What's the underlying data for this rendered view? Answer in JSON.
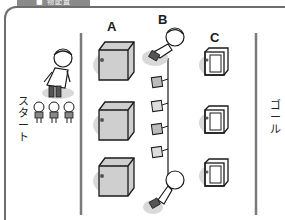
{
  "header": {
    "tab_label": "■ 物配置"
  },
  "labels": {
    "a": "A",
    "b": "B",
    "c": "C"
  },
  "start": {
    "text": "スタート",
    "chars": [
      "ス",
      "タ",
      "ー",
      "ト"
    ]
  },
  "goal": {
    "text": "ゴール",
    "chars": [
      "ゴ",
      "ー",
      "ル"
    ]
  },
  "colors": {
    "frame": "#6e6e6e",
    "line": "#7a7a7a",
    "box_fill": "#cfcfcf",
    "box_face": "#b5b5b5",
    "shadow": "#d9d9d9",
    "ink": "#1a1a1a"
  },
  "rows": {
    "a_boxes": 3,
    "c_boxes": 3,
    "b_cards": 4,
    "children": 3
  }
}
